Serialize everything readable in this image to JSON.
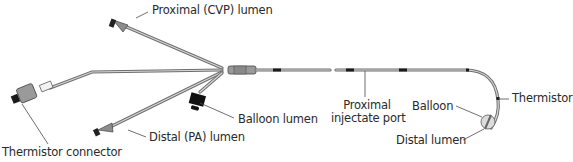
{
  "figure": {
    "labels": {
      "proximal_cvp_lumen": "Proximal (CVP) lumen",
      "balloon_lumen": "Balloon lumen",
      "distal_pa_lumen": "Distal (PA) lumen",
      "thermistor_connector": "Thermistor connector",
      "proximal_injectate_port_line1": "Proximal",
      "proximal_injectate_port_line2": "injectate port",
      "balloon": "Balloon",
      "thermistor": "Thermistor",
      "distal_lumen": "Distal lumen"
    },
    "colors": {
      "line": "#4a4a4a",
      "tube": "#6e6e6e",
      "connector": "#9a9a9a",
      "marker": "#1a1a1a",
      "text": "#2a2a2a"
    }
  }
}
